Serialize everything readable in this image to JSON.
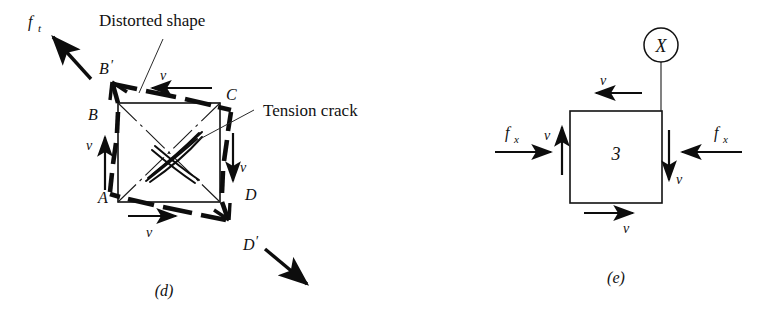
{
  "figure": {
    "background_color": "#ffffff",
    "ink_color": "#0d0d0d",
    "width": 771,
    "height": 324
  },
  "panel_d": {
    "caption": "(d)",
    "annotations": {
      "distorted_shape": "Distorted shape",
      "tension_crack": "Tension crack"
    },
    "force_labels": {
      "ft": "f",
      "ft_sub": "t"
    },
    "corner_labels": {
      "a": "A",
      "b": "B",
      "c": "C",
      "d": "D",
      "b_prime": "B",
      "b_prime_mark": "′",
      "d_prime": "D",
      "d_prime_mark": "′"
    },
    "velocity_labels": {
      "top": "v",
      "left": "v",
      "right": "v",
      "bottom": "v"
    },
    "square": {
      "x": 118,
      "y": 103,
      "width": 102,
      "height": 99
    },
    "distorted_polygon": "B' (112,82) → C' (229,109) → D' (228,219) → A' (110,193)"
  },
  "panel_e": {
    "caption": "(e)",
    "element_number": "3",
    "circle_label": "X",
    "force_labels": {
      "fx_left": "f",
      "fx_left_sub": "x",
      "fx_right": "f",
      "fx_right_sub": "x"
    },
    "velocity_labels": {
      "top": "v",
      "left": "v",
      "right": "v",
      "bottom": "v"
    },
    "square": {
      "x": 570,
      "y": 111,
      "width": 92,
      "height": 92
    }
  }
}
